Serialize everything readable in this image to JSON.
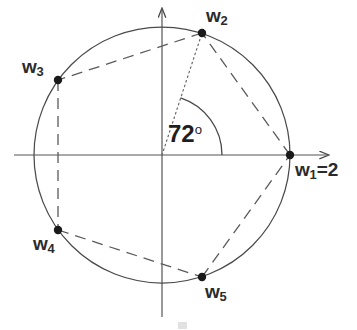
{
  "figure": {
    "type": "complex-plane-roots-diagram",
    "background_color": "#ffffff",
    "stroke_color": "#4a4a4a",
    "text_color": "#2b2b2b",
    "geometry": {
      "origin": {
        "x": 162,
        "y": 155
      },
      "radius": 128,
      "circle_label": "unit circle of radius 2"
    },
    "axes": {
      "x_axis": {
        "x1": 14,
        "y1": 155,
        "x2": 332,
        "y2": 155,
        "arrow": "right"
      },
      "y_axis": {
        "x1": 162,
        "y1": 317,
        "x2": 162,
        "y2": 4,
        "arrow": "up"
      }
    },
    "angle": {
      "value": 72,
      "unit": "degrees",
      "label": "72",
      "degree_symbol": "o",
      "arc_radius": 60,
      "from_deg": 0,
      "to_deg": 72
    },
    "points": [
      {
        "id": "w1",
        "label": "w",
        "subscript": "1",
        "suffix": "=2",
        "angle_deg": 0,
        "x": 290,
        "y": 155
      },
      {
        "id": "w2",
        "label": "w",
        "subscript": "2",
        "suffix": "",
        "angle_deg": 72,
        "x": 202,
        "y": 33
      },
      {
        "id": "w3",
        "label": "w",
        "subscript": "3",
        "suffix": "",
        "angle_deg": 144,
        "x": 58,
        "y": 80
      },
      {
        "id": "w4",
        "label": "w",
        "subscript": "4",
        "suffix": "",
        "angle_deg": 216,
        "x": 58,
        "y": 230
      },
      {
        "id": "w5",
        "label": "w",
        "subscript": "5",
        "suffix": "",
        "angle_deg": 288,
        "x": 202,
        "y": 277
      }
    ],
    "edges": [
      {
        "from": "w1",
        "to": "w2",
        "style": "dashed"
      },
      {
        "from": "w2",
        "to": "w3",
        "style": "dashed"
      },
      {
        "from": "w3",
        "to": "w4",
        "style": "dashed"
      },
      {
        "from": "w4",
        "to": "w5",
        "style": "dashed"
      },
      {
        "from": "w5",
        "to": "w1",
        "style": "dashed"
      }
    ],
    "radius_line": {
      "from": "origin",
      "to": "w2",
      "style": "dotted"
    }
  }
}
